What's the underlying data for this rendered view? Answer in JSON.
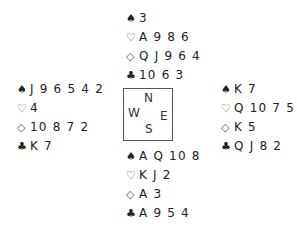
{
  "diagram": {
    "type": "bridge-deal",
    "hands": {
      "north": {
        "spades": "3",
        "hearts": "A 9 8 6",
        "diamonds": "Q J 9 6 4",
        "clubs": "10 6 3"
      },
      "west": {
        "spades": "J 9 6 5 4 2",
        "hearts": "4",
        "diamonds": "10 8 7 2",
        "clubs": "K 7"
      },
      "east": {
        "spades": "K 7",
        "hearts": "Q 10 7 5 3",
        "diamonds": "K 5",
        "clubs": "Q J 8 2"
      },
      "south": {
        "spades": "A Q 10 8",
        "hearts": "K J 2",
        "diamonds": "A 3",
        "clubs": "A 9 5 4"
      }
    },
    "compass": {
      "n": "N",
      "s": "S",
      "e": "E",
      "w": "W"
    },
    "suit_symbols": {
      "spades": "♠",
      "hearts": "♡",
      "diamonds": "◇",
      "clubs": "♣"
    }
  }
}
